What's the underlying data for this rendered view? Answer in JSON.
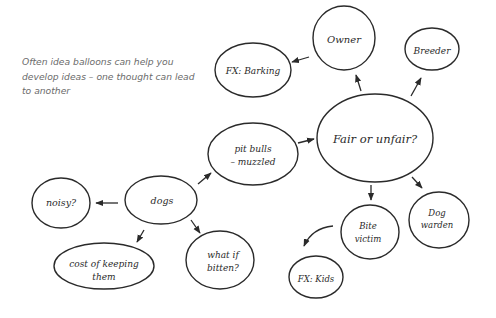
{
  "caption": "Often idea balloons can help you develop ideas – one thought can lead to another",
  "nodes": {
    "owner": {
      "label": "Owner"
    },
    "breeder": {
      "label": "Breeder"
    },
    "fx_barking": {
      "label": "FX: Barking"
    },
    "fair_unfair": {
      "label": "Fair or unfair?"
    },
    "pit_bulls": {
      "line1": "pit bulls",
      "line2": "– muzzled"
    },
    "dogs": {
      "label": "dogs"
    },
    "noisy": {
      "label": "noisy?"
    },
    "cost": {
      "line1": "cost of keeping",
      "line2": "them"
    },
    "what_if": {
      "line1": "what if",
      "line2": "bitten?"
    },
    "bite_victim": {
      "line1": "Bite",
      "line2": "victim"
    },
    "dog_warden": {
      "line1": "Dog",
      "line2": "warden"
    },
    "fx_kids": {
      "label": "FX: Kids"
    }
  },
  "edges": [
    [
      "dogs",
      "noisy"
    ],
    [
      "dogs",
      "cost"
    ],
    [
      "dogs",
      "what_if"
    ],
    [
      "dogs",
      "pit_bulls"
    ],
    [
      "pit_bulls",
      "fair_unfair"
    ],
    [
      "fair_unfair",
      "owner"
    ],
    [
      "fair_unfair",
      "breeder"
    ],
    [
      "fair_unfair",
      "bite_victim"
    ],
    [
      "fair_unfair",
      "dog_warden"
    ],
    [
      "owner",
      "fx_barking"
    ],
    [
      "bite_victim",
      "fx_kids"
    ]
  ]
}
